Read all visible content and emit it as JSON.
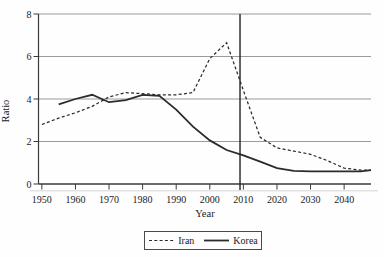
{
  "figure": {
    "background": "#fefefe",
    "legend": [
      {
        "label": "Iran",
        "style": "dashed"
      },
      {
        "label": "Korea",
        "style": "solid"
      }
    ]
  },
  "colors": {
    "line": "#2b2b2b",
    "axis": "#3a3a3a",
    "grid": "#909090",
    "shadow_rule": "#c9c9c9",
    "text": "#1c1c1c"
  },
  "chart_data": {
    "type": "line",
    "title": "",
    "xlabel": "Year",
    "ylabel": "Ratio",
    "xlim": [
      1949,
      2048
    ],
    "ylim": [
      0,
      8
    ],
    "x_ticks": [
      1950,
      1960,
      1970,
      1980,
      1990,
      2000,
      2010,
      2020,
      2030,
      2040
    ],
    "y_ticks": [
      0,
      2,
      4,
      6,
      8
    ],
    "grid": "horizontal",
    "legend_position": "bottom-center",
    "reference_line": {
      "axis": "x",
      "value": 2009
    },
    "series": [
      {
        "name": "Iran",
        "style": "dashed",
        "color": "#2b2b2b",
        "x": [
          1950,
          1955,
          1960,
          1965,
          1970,
          1975,
          1980,
          1985,
          1990,
          1995,
          2000,
          2005,
          2010,
          2015,
          2020,
          2025,
          2030,
          2035,
          2040,
          2045,
          2048
        ],
        "values": [
          2.8,
          3.1,
          3.35,
          3.65,
          4.1,
          4.3,
          4.25,
          4.2,
          4.2,
          4.3,
          5.9,
          6.65,
          4.4,
          2.2,
          1.7,
          1.55,
          1.4,
          1.1,
          0.75,
          0.65,
          0.65
        ]
      },
      {
        "name": "Korea",
        "style": "solid",
        "color": "#2b2b2b",
        "x": [
          1955,
          1960,
          1965,
          1970,
          1975,
          1980,
          1985,
          1990,
          1995,
          2000,
          2005,
          2010,
          2015,
          2020,
          2025,
          2030,
          2035,
          2040,
          2045,
          2048
        ],
        "values": [
          3.75,
          4.0,
          4.2,
          3.85,
          3.95,
          4.2,
          4.15,
          3.5,
          2.7,
          2.05,
          1.6,
          1.35,
          1.05,
          0.75,
          0.62,
          0.6,
          0.6,
          0.6,
          0.6,
          0.65
        ]
      }
    ]
  }
}
